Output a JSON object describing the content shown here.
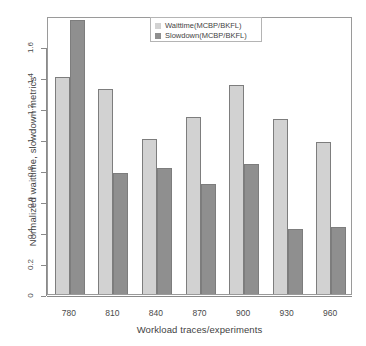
{
  "chart_data": {
    "type": "bar",
    "title": "",
    "subtitle": "",
    "xlabel": "Workload traces/experiments",
    "ylabel": "Normalized waittime, slowdown metrics",
    "categories": [
      "780",
      "810",
      "840",
      "870",
      "900",
      "930",
      "960"
    ],
    "series": [
      {
        "name": "Waittime(MCBP/BKFL)",
        "color": "#d2d2d2",
        "values": [
          1.42,
          1.34,
          1.02,
          1.16,
          1.37,
          1.15,
          1.0
        ]
      },
      {
        "name": "Slowdown(MCBP/BKFL)",
        "color": "#8f8f8f",
        "values": [
          1.79,
          0.8,
          0.83,
          0.73,
          0.86,
          0.44,
          0.45
        ]
      }
    ],
    "ylim": [
      0,
      1.8
    ],
    "yticks": [
      "0",
      "0.2",
      "0.4",
      "0.6",
      "0.8",
      "1",
      "1.2",
      "1.4",
      "1.6"
    ],
    "ytick_values": [
      0,
      0.2,
      0.4,
      0.6,
      0.8,
      1.0,
      1.2,
      1.4,
      1.6
    ],
    "grid": false,
    "legend_position": "top-center"
  },
  "legend": {
    "entries": [
      {
        "label": "Waittime(MCBP/BKFL)"
      },
      {
        "label": "Slowdown(MCBP/BKFL)"
      }
    ]
  }
}
